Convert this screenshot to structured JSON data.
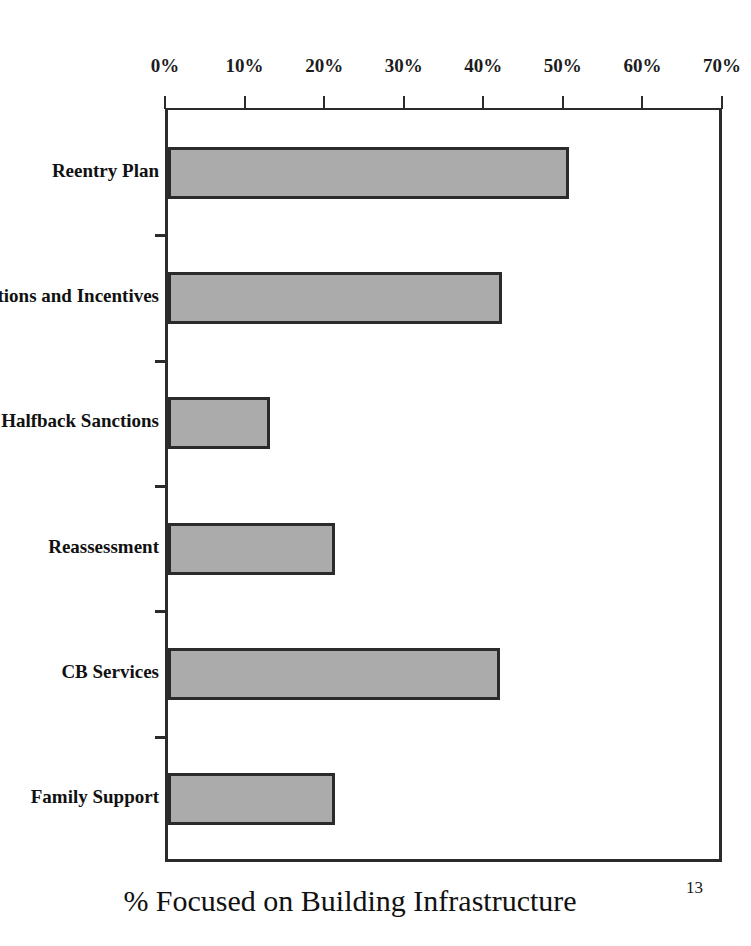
{
  "chart_data": {
    "type": "bar",
    "orientation": "horizontal",
    "title": "",
    "xlabel": "% Focused on Building Infrastructure",
    "ylabel": "",
    "categories": [
      "Reentry Plan",
      "anctions and Incentives",
      "Halfback Sanctions",
      "Reassessment",
      "CB Services",
      "Family Support"
    ],
    "values": [
      50.4,
      42.0,
      12.8,
      21.0,
      41.7,
      21.0
    ],
    "xlim": [
      0,
      70
    ],
    "xticks": [
      0,
      10,
      20,
      30,
      40,
      50,
      60,
      70
    ],
    "xtick_labels": [
      "0%",
      "10%",
      "20%",
      "30%",
      "40%",
      "50%",
      "60%",
      "70%"
    ],
    "grid": false,
    "legend": null,
    "axis_position": "top",
    "bar_fill_color": "#ababab",
    "bar_edge_color": "#2b2b2b",
    "background_color": "#ffffff"
  },
  "footer": {
    "page_number": "13"
  }
}
